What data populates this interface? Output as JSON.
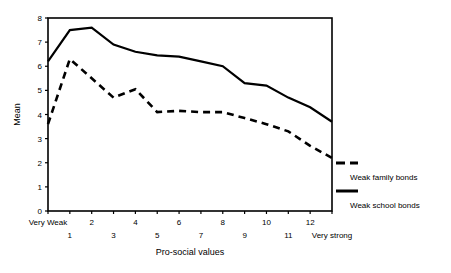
{
  "chart_data": {
    "type": "line",
    "title": "",
    "xlabel": "Pro-social values",
    "ylabel": "Mean",
    "ylim": [
      0,
      8
    ],
    "grid": false,
    "legend_position": "right",
    "categories": [
      "Very Weak",
      "1",
      "2",
      "3",
      "4",
      "5",
      "6",
      "7",
      "8",
      "9",
      "10",
      "11",
      "12",
      "Very strong"
    ],
    "xtick_labels_row1": [
      "Very Weak",
      "",
      "2",
      "",
      "4",
      "",
      "6",
      "",
      "8",
      "",
      "10",
      "",
      "12",
      ""
    ],
    "xtick_labels_row2": [
      "",
      "1",
      "",
      "3",
      "",
      "5",
      "",
      "7",
      "",
      "9",
      "",
      "11",
      "",
      "Very strong"
    ],
    "ytick_labels": [
      "0",
      "1",
      "2",
      "3",
      "4",
      "5",
      "6",
      "7",
      "8"
    ],
    "yticks": [
      0,
      1,
      2,
      3,
      4,
      5,
      6,
      7,
      8
    ],
    "series": [
      {
        "name": "Weak school bonds",
        "style": "solid",
        "color": "#000000",
        "values": [
          6.2,
          7.5,
          7.6,
          6.9,
          6.6,
          6.45,
          6.4,
          6.2,
          6.0,
          5.3,
          5.2,
          4.7,
          4.3,
          3.7
        ]
      },
      {
        "name": "Weak family bonds",
        "style": "dashed",
        "color": "#000000",
        "values": [
          3.6,
          6.3,
          5.5,
          4.7,
          5.05,
          4.1,
          4.15,
          4.1,
          4.1,
          3.85,
          3.6,
          3.3,
          2.7,
          2.2
        ]
      }
    ]
  },
  "legend": {
    "items": [
      {
        "label": "Weak family bonds",
        "style": "dashed"
      },
      {
        "label": "Weak school bonds",
        "style": "solid"
      }
    ]
  },
  "axis": {
    "y_title": "Mean",
    "x_title": "Pro-social values"
  }
}
